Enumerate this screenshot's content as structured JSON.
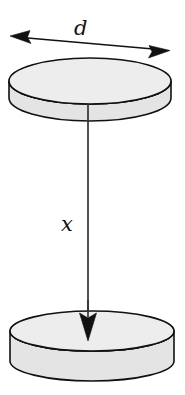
{
  "figure": {
    "background_color": "#ffffff",
    "width": 185,
    "height": 395,
    "labels": {
      "diameter": "d",
      "separation": "x"
    },
    "colors": {
      "disk_face": "#ededed",
      "disk_side": "#e4e4e4",
      "outline": "#111111",
      "arrow": "#111111",
      "axis_line": "#333333",
      "label_text": "#131313"
    },
    "elements": {
      "top_disk": {
        "name": "top-disk",
        "center_x": 90,
        "center_y": 81,
        "radius_x": 81,
        "radius_y": 23,
        "thickness": 17
      },
      "bottom_disk": {
        "name": "bottom-disk",
        "center_x": 92,
        "center_y": 331,
        "radius_x": 82,
        "radius_y": 20,
        "thickness": 30
      },
      "diameter_arrow": {
        "name": "diameter-dimension-arrow",
        "double_headed": true,
        "x1": 12,
        "y1": 36,
        "x2": 168,
        "y2": 50
      },
      "separation_arrow": {
        "name": "separation-arrow",
        "double_headed": false,
        "x1": 88,
        "y1": 121,
        "x2": 88,
        "y2": 341
      }
    }
  }
}
